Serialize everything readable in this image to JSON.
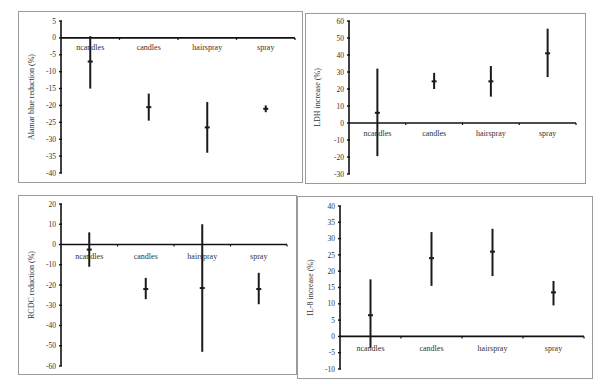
{
  "chart_data": [
    {
      "type": "scatter",
      "title": "",
      "xlabel": "",
      "ylabel": "Alamar blue reduction (%)",
      "categories": [
        "ncandles",
        "candles",
        "hairspray",
        "spray"
      ],
      "ylim": [
        -40,
        5
      ],
      "yticks": [
        5,
        0,
        -5,
        -10,
        -15,
        -20,
        -25,
        -30,
        -35,
        -40
      ],
      "values": [
        -7,
        -20.5,
        -26.5,
        -21
      ],
      "error_low": [
        -15,
        -24.5,
        -34,
        -22
      ],
      "error_high": [
        0.5,
        -16.5,
        -19,
        -20
      ],
      "grid": false
    },
    {
      "type": "scatter",
      "title": "",
      "xlabel": "",
      "ylabel": "LDH increase (%)",
      "categories": [
        "ncandles",
        "candles",
        "hairspray",
        "spray"
      ],
      "ylim": [
        -30,
        60
      ],
      "yticks": [
        60,
        50,
        40,
        30,
        20,
        10,
        0,
        -10,
        -20,
        -30
      ],
      "values": [
        6,
        24.5,
        24.5,
        41
      ],
      "error_low": [
        -19.5,
        20,
        15.5,
        27
      ],
      "error_high": [
        32,
        29.5,
        33.5,
        55.5
      ],
      "grid": false
    },
    {
      "type": "scatter",
      "title": "",
      "xlabel": "",
      "ylabel": "RCDC reduction (%)",
      "categories": [
        "ncandles",
        "candles",
        "hairspray",
        "spray"
      ],
      "ylim": [
        -60,
        20
      ],
      "yticks": [
        20,
        10,
        0,
        -10,
        -20,
        -30,
        -40,
        -50,
        -60
      ],
      "values": [
        -2.5,
        -22,
        -21.5,
        -22
      ],
      "error_low": [
        -11,
        -27,
        -53,
        -29.5
      ],
      "error_high": [
        6,
        -16.5,
        10,
        -14
      ],
      "grid": false
    },
    {
      "type": "scatter",
      "title": "",
      "xlabel": "",
      "ylabel": "IL-8 increase (%)",
      "categories": [
        "ncandles",
        "candles",
        "hairspray",
        "spray"
      ],
      "ylim": [
        -10,
        40
      ],
      "yticks": [
        40,
        35,
        30,
        25,
        20,
        15,
        10,
        5,
        0,
        -5,
        -10
      ],
      "values": [
        6.5,
        24,
        26,
        13.5
      ],
      "error_low": [
        -3.5,
        15.5,
        18.5,
        9.5
      ],
      "error_high": [
        17.5,
        32,
        33,
        17
      ],
      "grid": false
    }
  ]
}
